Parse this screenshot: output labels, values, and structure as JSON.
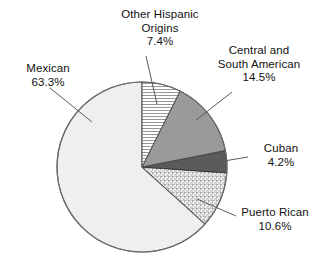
{
  "figure": {
    "width": 321,
    "height": 265,
    "background": "#ffffff"
  },
  "chart_data": {
    "type": "pie",
    "title": "",
    "subtitle": "",
    "xlabel": "",
    "ylabel": "",
    "units": "percent",
    "legend": "none",
    "grid": false,
    "start_angle_deg": 0,
    "direction": "clockwise",
    "center": {
      "x": 142,
      "y": 167
    },
    "radius": 85,
    "total": 100.0,
    "categories": [
      "Other Hispanic Origins",
      "Central and South American",
      "Cuban",
      "Puerto Rican",
      "Mexican"
    ],
    "values": [
      7.4,
      14.5,
      4.2,
      10.6,
      63.3
    ],
    "slices": [
      {
        "name": "Other Hispanic Origins",
        "label_line1": "Other Hispanic",
        "label_line2": "Origins",
        "value": 7.4,
        "value_text": "7.4%",
        "fill_style": "horizontal-hatch",
        "fill_color": "#ffffff",
        "hatch_color": "#8c8c8c",
        "stroke": "#4a4a4a",
        "start_deg": 0.0,
        "end_deg": 26.64
      },
      {
        "name": "Central and South American",
        "label_line1": "Central and",
        "label_line2": "South American",
        "value": 14.5,
        "value_text": "14.5%",
        "fill_style": "solid",
        "fill_color": "#9a9a9a",
        "hatch_color": "",
        "stroke": "#4a4a4a",
        "start_deg": 26.64,
        "end_deg": 78.84
      },
      {
        "name": "Cuban",
        "label_line1": "Cuban",
        "label_line2": "",
        "value": 4.2,
        "value_text": "4.2%",
        "fill_style": "solid",
        "fill_color": "#5a5a5a",
        "hatch_color": "",
        "stroke": "#3a3a3a",
        "start_deg": 78.84,
        "end_deg": 93.96
      },
      {
        "name": "Puerto Rican",
        "label_line1": "Puerto Rican",
        "label_line2": "",
        "value": 10.6,
        "value_text": "10.6%",
        "fill_style": "cross-hatch",
        "fill_color": "#ffffff",
        "hatch_color": "#9e9e9e",
        "stroke": "#4a4a4a",
        "start_deg": 93.96,
        "end_deg": 132.12
      },
      {
        "name": "Mexican",
        "label_line1": "Mexican",
        "label_line2": "",
        "value": 63.3,
        "value_text": "63.3%",
        "fill_style": "solid",
        "fill_color": "#efefef",
        "hatch_color": "",
        "stroke": "#6a6a6a",
        "start_deg": 132.12,
        "end_deg": 360.0
      }
    ]
  },
  "labels": {
    "other_hispanic": {
      "line1": "Other Hispanic",
      "line2": "Origins",
      "value": "7.4%"
    },
    "central_south": {
      "line1": "Central and",
      "line2": "South American",
      "value": "14.5%"
    },
    "cuban": {
      "line1": "Cuban",
      "value": "4.2%"
    },
    "puerto_rican": {
      "line1": "Puerto Rican",
      "value": "10.6%"
    },
    "mexican": {
      "line1": "Mexican",
      "value": "63.3%"
    }
  },
  "colors": {
    "slice_other_hispanic_hatch": "#8c8c8c",
    "slice_central_south": "#9a9a9a",
    "slice_cuban": "#5a5a5a",
    "slice_puerto_rican_hatch": "#9e9e9e",
    "slice_mexican": "#efefef",
    "outline": "#4a4a4a",
    "leader_line": "#5a5a5a",
    "text": "#111111",
    "background": "#ffffff"
  }
}
